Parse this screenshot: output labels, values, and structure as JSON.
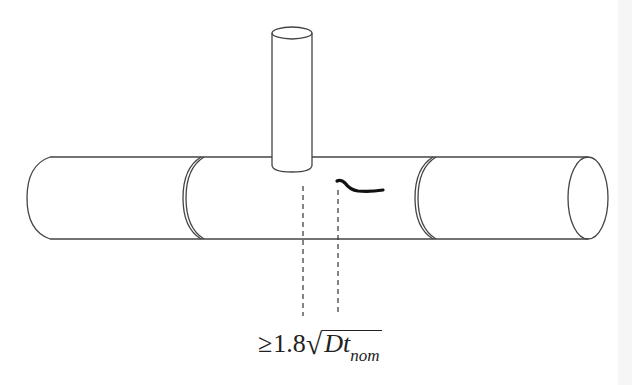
{
  "figure": {
    "colors": {
      "line": "#444444",
      "crack": "#111111",
      "background": "#ffffff"
    },
    "formula": {
      "relation": "≥",
      "coefficient": "1.8",
      "radicand_main": "Dt",
      "radicand_subscript": "nom"
    },
    "elements": [
      {
        "name": "main-pipe",
        "label": ""
      },
      {
        "name": "branch-pipe",
        "label": ""
      },
      {
        "name": "girth-weld-left",
        "label": ""
      },
      {
        "name": "girth-weld-right",
        "label": ""
      },
      {
        "name": "crack",
        "label": ""
      },
      {
        "name": "dimension-lines",
        "label": ""
      }
    ]
  }
}
